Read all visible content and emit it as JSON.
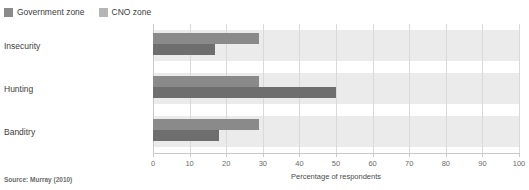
{
  "chart_data": {
    "type": "bar",
    "orientation": "horizontal",
    "title": "",
    "xlabel": "Percentage of respondents",
    "ylabel": "",
    "xlim": [
      0,
      100
    ],
    "xticks": [
      0,
      10,
      20,
      30,
      40,
      50,
      60,
      70,
      80,
      90,
      100
    ],
    "grid": true,
    "legend_position": "top-left",
    "categories": [
      "Insecurity",
      "Hunting",
      "Banditry"
    ],
    "series": [
      {
        "name": "Government zone",
        "color": "#8a8a8a",
        "values": [
          29,
          29,
          29
        ]
      },
      {
        "name": "CNO zone",
        "color": "#6e6e6e",
        "values": [
          17,
          50,
          18
        ]
      }
    ],
    "source": "Source: Murray (2010)"
  },
  "legend": {
    "items": [
      {
        "label": "Government zone",
        "swatch": "#8a8a8a"
      },
      {
        "label": "CNO zone",
        "swatch": "#b5b5b5"
      }
    ]
  },
  "colors": {
    "band": "#ebebeb",
    "gridline": "#d9d9d9",
    "axis": "#c9c9c9",
    "series_government": "#8a8a8a",
    "series_cno": "#6e6e6e",
    "text": "#3d3d3d"
  },
  "footer": {
    "source": "Source: Murray (2010)"
  },
  "axis": {
    "xlabel": "Percentage of respondents",
    "ticks": [
      "0",
      "10",
      "20",
      "30",
      "40",
      "50",
      "60",
      "70",
      "80",
      "90",
      "100"
    ]
  }
}
